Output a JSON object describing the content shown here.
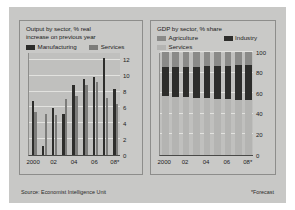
{
  "figure": {
    "background_color": "#c8c8c6",
    "source_note": "Source: Economist Intelligence Unit",
    "forecast_note": "*Forecast"
  },
  "chart_data": [
    {
      "type": "bar",
      "panel": "left",
      "title": "Output by sector, % real increase on previous year",
      "title_line1": "Output by sector, % real",
      "title_line2": "increase on previous year",
      "xlabel": "",
      "ylabel": "",
      "ylim": [
        0,
        13
      ],
      "yticks": [
        0,
        2,
        4,
        6,
        8,
        10,
        12
      ],
      "grid": true,
      "legend_position": "top",
      "categories": [
        "2000",
        "01",
        "02",
        "03",
        "04",
        "05",
        "06",
        "07",
        "08*"
      ],
      "tick_categories": [
        "2000",
        "02",
        "04",
        "06",
        "08*"
      ],
      "series": [
        {
          "name": "Manufacturing",
          "color": "#2d2d2b",
          "values": [
            6.8,
            1.2,
            5.9,
            5.2,
            8.8,
            9.6,
            9.9,
            12.3,
            8.3
          ]
        },
        {
          "name": "Services",
          "color": "#7c7c7a",
          "values": [
            5.4,
            5.2,
            5.1,
            7.1,
            7.5,
            8.8,
            9.2,
            7.2,
            6.4
          ]
        }
      ]
    },
    {
      "type": "bar",
      "subtype": "stacked",
      "panel": "right",
      "title": "GDP by sector, % share",
      "xlabel": "",
      "ylabel": "",
      "ylim": [
        0,
        100
      ],
      "yticks": [
        0,
        20,
        40,
        60,
        80,
        100
      ],
      "grid": true,
      "legend_position": "top",
      "categories": [
        "2000",
        "01",
        "02",
        "03",
        "04",
        "05",
        "06",
        "07",
        "08*"
      ],
      "tick_categories": [
        "2000",
        "02",
        "04",
        "06",
        "08*"
      ],
      "series": [
        {
          "name": "Services",
          "color": "#b4b4b2",
          "values": [
            57,
            56,
            56,
            55,
            55,
            54,
            54,
            53,
            53
          ]
        },
        {
          "name": "Industry",
          "color": "#2d2d2b",
          "values": [
            28,
            29,
            29,
            30,
            31,
            32,
            32,
            34,
            34
          ]
        },
        {
          "name": "Agriculture",
          "color": "#8a8a88",
          "values": [
            15,
            15,
            15,
            15,
            14,
            14,
            14,
            13,
            13
          ]
        }
      ]
    }
  ]
}
